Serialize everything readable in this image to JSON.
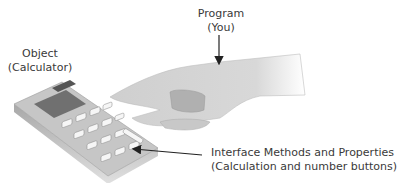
{
  "labels": {
    "program": {
      "line1": "Program",
      "line2": "(You)"
    },
    "object": {
      "line1": "Object",
      "line2": "(Calculator)"
    },
    "interface": {
      "line1": "Interface Methods and Properties",
      "line2": "(Calculation and number buttons)"
    }
  },
  "colors": {
    "text": "#3a3a3a",
    "hand": "#d4d4d4",
    "calculator_body": "#b8b8b8",
    "calculator_top": "#c8c8c8",
    "display": "#6e6e6e",
    "buttons": "#f4f4f4",
    "arrow": "#222222"
  }
}
